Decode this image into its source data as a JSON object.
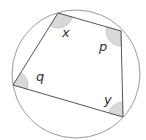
{
  "diagram": {
    "type": "cyclic-quadrilateral",
    "circle": {
      "cx": 76,
      "cy": 74,
      "r": 64,
      "stroke": "#9a9a9a"
    },
    "vertices": [
      {
        "id": "top",
        "x": 58,
        "y": 13,
        "angle_label": "x"
      },
      {
        "id": "right",
        "x": 121,
        "y": 31,
        "angle_label": "p"
      },
      {
        "id": "bottom-right",
        "x": 123,
        "y": 117,
        "angle_label": "y"
      },
      {
        "id": "left",
        "x": 13,
        "y": 85,
        "angle_label": "q"
      }
    ],
    "labels": {
      "x": {
        "text": "x",
        "x": 62,
        "y": 37
      },
      "p": {
        "text": "p",
        "x": 100,
        "y": 50
      },
      "q": {
        "text": "q",
        "x": 36,
        "y": 80
      },
      "y": {
        "text": "y",
        "x": 104,
        "y": 104
      }
    },
    "colors": {
      "edge": "#555555",
      "circle": "#9a9a9a",
      "angle_fill": "#d9d9d9",
      "angle_stroke": "#b5b5b5",
      "label": "#333333"
    }
  }
}
